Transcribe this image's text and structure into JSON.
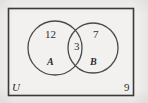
{
  "diagram": {
    "type": "venn-2-set",
    "universe_label": "U",
    "sets": [
      {
        "id": "A",
        "label": "A"
      },
      {
        "id": "B",
        "label": "B"
      }
    ],
    "regions": [
      {
        "id": "a-only",
        "label": "A only",
        "count": "12"
      },
      {
        "id": "both",
        "label": "A and B",
        "count": "3"
      },
      {
        "id": "b-only",
        "label": "B only",
        "count": "7"
      },
      {
        "id": "outside",
        "label": "outside A and B",
        "count": "9"
      }
    ],
    "colors": {
      "background": "#f2f1ef",
      "stroke": "#3a3a3a",
      "text": "#2b2b2b"
    }
  }
}
